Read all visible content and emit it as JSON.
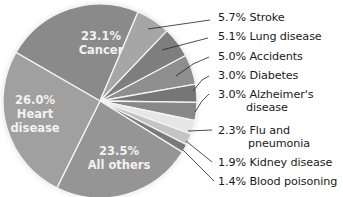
{
  "chart_data": {
    "type": "pie",
    "title": "",
    "start_angle_deg": -150,
    "direction": "clockwise",
    "slices": [
      {
        "label": "Cancer",
        "value": 23.1,
        "display": "23.1%",
        "color": "#8a8a8a",
        "inside": true
      },
      {
        "label": "Stroke",
        "value": 5.7,
        "display": "5.7% Stroke",
        "color": "#a6a6a6"
      },
      {
        "label": "Lung disease",
        "value": 5.1,
        "display": "5.1% Lung disease",
        "color": "#7e7e7e"
      },
      {
        "label": "Accidents",
        "value": 5.0,
        "display": "5.0% Accidents",
        "color": "#8e8e8e"
      },
      {
        "label": "Diabetes",
        "value": 3.0,
        "display": "3.0% Diabetes",
        "color": "#767676"
      },
      {
        "label": "Alzheimer's disease",
        "value": 3.0,
        "display": "3.0% Alzheimer's disease",
        "color": "#888888"
      },
      {
        "label": "Flu and pneumonia",
        "value": 2.3,
        "display": "2.3% Flu and pneumonia",
        "color": "#e6e6e6"
      },
      {
        "label": "Kidney disease",
        "value": 1.9,
        "display": "1.9% Kidney disease",
        "color": "#c4c4c4"
      },
      {
        "label": "Blood poisoning",
        "value": 1.4,
        "display": "1.4% Blood poisoning",
        "color": "#7a7a7a"
      },
      {
        "label": "All others",
        "value": 23.5,
        "display": "23.5%",
        "color": "#959595",
        "inside": true
      },
      {
        "label": "Heart disease",
        "value": 26.0,
        "display": "26.0%",
        "color": "#a0a0a0",
        "inside": true
      }
    ]
  },
  "labels": {
    "cancer_pct": "23.1%",
    "cancer_name": "Cancer",
    "heart_pct": "26.0%",
    "heart_name1": "Heart",
    "heart_name2": "disease",
    "others_pct": "23.5%",
    "others_name": "All others",
    "stroke": "5.7% Stroke",
    "lung": "5.1% Lung disease",
    "accidents": "5.0% Accidents",
    "diabetes": "3.0% Diabetes",
    "alz1": "3.0% Alzheimer's",
    "alz2": "disease",
    "flu1": "2.3% Flu and",
    "flu2": "pneumonia",
    "kidney": "1.9% Kidney disease",
    "blood": "1.4% Blood poisoning"
  }
}
